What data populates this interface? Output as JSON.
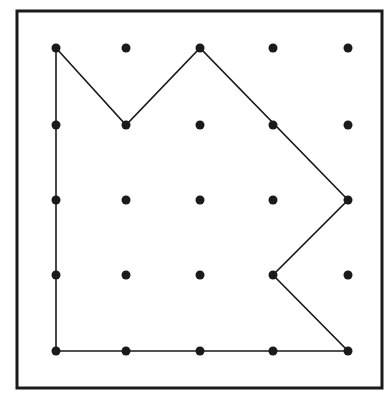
{
  "diagram": {
    "type": "geoboard",
    "grid": {
      "columns": 5,
      "rows": 5
    },
    "colors": {
      "background": "#ffffff",
      "ink": "#1a1a1a"
    },
    "frame": {
      "x": 17,
      "y": 11,
      "width": 365,
      "height": 377
    },
    "grid_x": [
      56,
      126,
      200,
      273,
      348
    ],
    "grid_y": [
      48,
      125,
      200,
      275,
      351
    ],
    "polygon": [
      [
        0,
        0
      ],
      [
        1,
        1
      ],
      [
        2,
        0
      ],
      [
        4,
        2
      ],
      [
        3,
        3
      ],
      [
        4,
        4
      ],
      [
        0,
        4
      ]
    ]
  }
}
